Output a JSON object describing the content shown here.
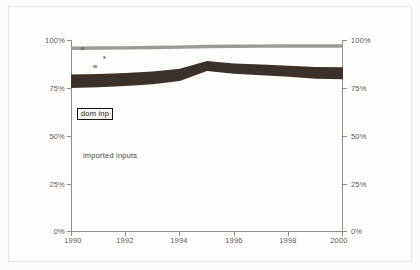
{
  "figure": {
    "background_color": "#fdfdfb",
    "frame_color": "#e7e6e1"
  },
  "chart_data": {
    "type": "area",
    "title": "",
    "subtitle": "",
    "xlabel": "",
    "ylabel": "",
    "grid": false,
    "legend_position": "in-plot annotations",
    "xlim": [
      1990,
      2000
    ],
    "ylim": [
      0,
      100
    ],
    "y_unit": "%",
    "x_tick_labels": [
      "1990",
      "1992",
      "1994",
      "1996",
      "1998",
      "2000"
    ],
    "x_tick_values": [
      1990,
      1992,
      1994,
      1996,
      1998,
      2000
    ],
    "y_tick_labels_left": [
      "100%",
      "75%",
      "50%",
      "25%",
      "0%"
    ],
    "y_tick_labels_right": [
      "100%",
      "75%",
      "50%",
      "25%",
      "0%"
    ],
    "y_tick_values": [
      100,
      75,
      50,
      25,
      0
    ],
    "x": [
      1990,
      1991,
      1992,
      1993,
      1994,
      1995,
      1996,
      1997,
      1998,
      1999,
      2000
    ],
    "series": [
      {
        "name": "imported inputs",
        "label": "imported inputs",
        "color": "#ffffff",
        "role": "lower-region",
        "values": [
          75.0,
          75.4,
          76.0,
          77.0,
          78.6,
          83.8,
          82.4,
          81.6,
          80.8,
          79.8,
          79.6
        ]
      },
      {
        "name": "dom inp",
        "label": "dom inp",
        "color": "#3a312a",
        "role": "dark-band",
        "band_lower": [
          75.0,
          75.4,
          76.0,
          77.0,
          78.6,
          83.8,
          82.4,
          81.6,
          80.8,
          79.8,
          79.6
        ],
        "band_upper": [
          82.0,
          82.3,
          82.8,
          83.6,
          85.0,
          89.0,
          87.8,
          87.2,
          86.6,
          85.9,
          85.8
        ]
      },
      {
        "name": "upper gray band",
        "label": "",
        "color": "#9b9a92",
        "role": "gray-band",
        "band_lower": [
          94.8,
          94.9,
          95.0,
          95.2,
          95.4,
          95.7,
          95.8,
          95.9,
          96.0,
          96.0,
          96.0
        ],
        "band_upper": [
          96.6,
          96.7,
          96.8,
          97.0,
          97.2,
          97.5,
          97.6,
          97.7,
          97.8,
          97.8,
          97.8
        ]
      }
    ],
    "annotations": [
      {
        "name": "dom-inp-label",
        "text": "dom inp",
        "x": 1990.3,
        "y": 81.0,
        "boxed": true
      },
      {
        "name": "imported-inputs-label",
        "text": "imported inputs",
        "x": 1990.5,
        "y": 41.0,
        "boxed": false
      },
      {
        "name": "marker-o",
        "text": "o",
        "x": 1990.4,
        "y": 99.0,
        "boxed": false
      },
      {
        "name": "marker-w",
        "text": "w",
        "x": 1990.9,
        "y": 91.0,
        "boxed": false
      },
      {
        "name": "marker-s",
        "text": "s",
        "x": 1991.3,
        "y": 95.5,
        "boxed": false
      }
    ]
  }
}
